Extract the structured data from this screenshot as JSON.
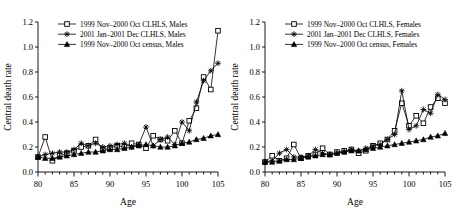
{
  "figure": {
    "panels": [
      {
        "id": "males",
        "legend": [
          {
            "marker": "open-square",
            "label": "1999 Nov–2000 Oct CLHLS, Males"
          },
          {
            "marker": "asterisk",
            "label": "2001 Jan–2001 Dec CLHLS, Males"
          },
          {
            "marker": "filled-triangle",
            "label": "1999 Nov–2000 Oct census, Males"
          }
        ],
        "chart_data": {
          "type": "line",
          "title": "",
          "xlabel": "Age",
          "ylabel": "Central death rate",
          "xlim": [
            80,
            105
          ],
          "ylim": [
            0.0,
            1.2
          ],
          "xticks": [
            80,
            85,
            90,
            95,
            100,
            105
          ],
          "yticks": [
            0.0,
            0.2,
            0.4,
            0.6,
            0.8,
            1.0,
            1.2
          ],
          "xtick_labels": [
            "80",
            "85",
            "90",
            "95",
            "100",
            "105"
          ],
          "ytick_labels": [
            "0.0",
            "0.2",
            "0.4",
            "0.6",
            "0.8",
            "1.0",
            "1.2"
          ],
          "minor_xtick_step": 1,
          "grid": false,
          "legend_position": "top-left",
          "x": [
            80,
            81,
            82,
            83,
            84,
            85,
            86,
            87,
            88,
            89,
            90,
            91,
            92,
            93,
            94,
            95,
            96,
            97,
            98,
            99,
            100,
            101,
            102,
            103,
            104,
            105
          ],
          "series": [
            {
              "name": "1999 Nov–2000 Oct CLHLS, Males",
              "marker": "open-square",
              "values": [
                0.12,
                0.28,
                0.09,
                0.13,
                0.15,
                0.17,
                0.2,
                0.21,
                0.26,
                0.18,
                0.19,
                0.21,
                0.2,
                0.23,
                0.22,
                0.19,
                0.29,
                0.26,
                0.25,
                0.33,
                0.23,
                0.41,
                0.51,
                0.76,
                0.66,
                1.13
              ]
            },
            {
              "name": "2001 Jan–2001 Dec CLHLS, Males",
              "marker": "asterisk",
              "values": [
                0.12,
                0.14,
                0.15,
                0.16,
                0.16,
                0.18,
                0.23,
                0.21,
                0.23,
                0.2,
                0.21,
                0.22,
                0.23,
                0.2,
                0.22,
                0.36,
                0.21,
                0.26,
                0.28,
                0.22,
                0.4,
                0.33,
                0.56,
                0.73,
                0.81,
                0.87
              ]
            },
            {
              "name": "1999 Nov–2000 Oct census, Males",
              "marker": "filled-triangle",
              "values": [
                0.12,
                0.11,
                0.11,
                0.12,
                0.13,
                0.14,
                0.15,
                0.16,
                0.16,
                0.17,
                0.18,
                0.18,
                0.19,
                0.2,
                0.21,
                0.22,
                0.21,
                0.2,
                0.2,
                0.21,
                0.23,
                0.24,
                0.26,
                0.27,
                0.29,
                0.3
              ]
            }
          ]
        }
      },
      {
        "id": "females",
        "legend": [
          {
            "marker": "open-square",
            "label": "1999 Nov–2000 Oct CLHLS, Females"
          },
          {
            "marker": "asterisk",
            "label": "2001 Jan–2001 Dec CLHLS, Females"
          },
          {
            "marker": "filled-triangle",
            "label": "1999 Nov–2000 Oct census, Females"
          }
        ],
        "chart_data": {
          "type": "line",
          "title": "",
          "xlabel": "Age",
          "ylabel": "Central death rate",
          "xlim": [
            80,
            105
          ],
          "ylim": [
            0.0,
            1.2
          ],
          "xticks": [
            80,
            85,
            90,
            95,
            100,
            105
          ],
          "yticks": [
            0.0,
            0.2,
            0.4,
            0.6,
            0.8,
            1.0,
            1.2
          ],
          "xtick_labels": [
            "80",
            "85",
            "90",
            "95",
            "100",
            "105"
          ],
          "ytick_labels": [
            "0.0",
            "0.2",
            "0.4",
            "0.6",
            "0.8",
            "1.0",
            "1.2"
          ],
          "minor_xtick_step": 1,
          "grid": false,
          "legend_position": "top-left",
          "x": [
            80,
            81,
            82,
            83,
            84,
            85,
            86,
            87,
            88,
            89,
            90,
            91,
            92,
            93,
            94,
            95,
            96,
            97,
            98,
            99,
            100,
            101,
            102,
            103,
            104,
            105
          ],
          "series": [
            {
              "name": "1999 Nov–2000 Oct CLHLS, Females",
              "marker": "open-square",
              "values": [
                0.08,
                0.13,
                0.09,
                0.11,
                0.22,
                0.11,
                0.13,
                0.14,
                0.19,
                0.14,
                0.16,
                0.17,
                0.18,
                0.15,
                0.17,
                0.21,
                0.23,
                0.26,
                0.33,
                0.55,
                0.37,
                0.45,
                0.39,
                0.52,
                0.59,
                0.55
              ]
            },
            {
              "name": "2001 Jan–2001 Dec CLHLS, Females",
              "marker": "asterisk",
              "values": [
                0.08,
                0.09,
                0.15,
                0.18,
                0.12,
                0.12,
                0.13,
                0.18,
                0.15,
                0.14,
                0.15,
                0.16,
                0.18,
                0.17,
                0.19,
                0.21,
                0.22,
                0.26,
                0.3,
                0.65,
                0.34,
                0.37,
                0.5,
                0.47,
                0.62,
                0.58
              ]
            },
            {
              "name": "1999 Nov–2000 Oct census, Females",
              "marker": "filled-triangle",
              "values": [
                0.08,
                0.08,
                0.09,
                0.1,
                0.1,
                0.11,
                0.12,
                0.13,
                0.14,
                0.14,
                0.15,
                0.16,
                0.17,
                0.17,
                0.18,
                0.19,
                0.2,
                0.21,
                0.22,
                0.23,
                0.24,
                0.25,
                0.26,
                0.28,
                0.29,
                0.31
              ]
            }
          ]
        }
      }
    ]
  }
}
